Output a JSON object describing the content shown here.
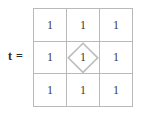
{
  "figure": {
    "width": 143,
    "height": 115,
    "background_color": "#ffffff",
    "grid_line_color": "#b9b9b9",
    "text_color": "#3a3a3a",
    "label_color": "#2b2b2b",
    "diamond_line_color": "#bdbdbd"
  },
  "label": {
    "variable": "t",
    "equals": "="
  },
  "matrix": {
    "rows": 3,
    "columns": 3,
    "cells": [
      {
        "id": "r1c1",
        "value": "1",
        "shape": "none"
      },
      {
        "id": "r1c2",
        "value": "1",
        "shape": "none"
      },
      {
        "id": "r1c3",
        "value": "1",
        "shape": "none"
      },
      {
        "id": "r2c1",
        "value": "1",
        "shape": "none"
      },
      {
        "id": "r2c2",
        "value": "1",
        "shape": "diamond"
      },
      {
        "id": "r2c3",
        "value": "1",
        "shape": "none"
      },
      {
        "id": "r3c1",
        "value": "1",
        "shape": "none"
      },
      {
        "id": "r3c2",
        "value": "1",
        "shape": "none"
      },
      {
        "id": "r3c3",
        "value": "1",
        "shape": "none"
      }
    ]
  }
}
